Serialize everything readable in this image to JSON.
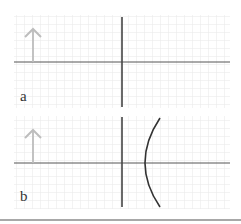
{
  "panels": [
    {
      "label": "a",
      "description": "Object arrow left of a plane mirror/axis, no optical element",
      "has_curve": false
    },
    {
      "label": "b",
      "description": "Object arrow left of the axis with a concave curved surface to the right",
      "has_curve": true
    }
  ],
  "colors": {
    "grid": "#e6e6e6",
    "axis": "#555555",
    "vertical_line": "#444444",
    "arrow": "#bdbdbd",
    "curve": "#333333",
    "divider": "#a8a8a8"
  },
  "icons": {
    "object_arrow": "up-arrow"
  }
}
